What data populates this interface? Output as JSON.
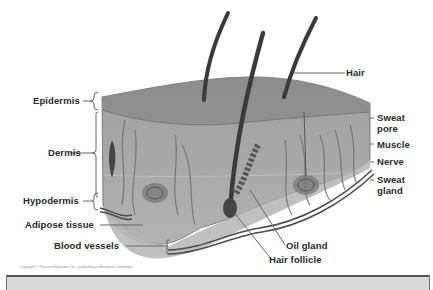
{
  "diagram": {
    "labels_left": {
      "epidermis": "Epidermis",
      "dermis": "Dermis",
      "hypodermis": "Hypodermis",
      "adipose": "Adipose tissue",
      "blood_vessels": "Blood vessels"
    },
    "labels_right": {
      "hair": "Hair",
      "sweat_pore_1": "Sweat",
      "sweat_pore_2": "pore",
      "muscle": "Muscle",
      "nerve": "Nerve",
      "sweat_gland_1": "Sweat",
      "sweat_gland_2": "gland"
    },
    "labels_bottom": {
      "oil_gland": "Oil gland",
      "hair_follicle": "Hair follicle"
    },
    "caption": "Copyright © Pearson Education, Inc., publishing as Benjamin Cummings",
    "colors": {
      "tissue": "#9a9a9a",
      "epidermis_top": "#8e8e8e",
      "hair": "#3a3a3a",
      "vessel": "#4a4a4a",
      "bar": "#d9d9d9"
    }
  }
}
